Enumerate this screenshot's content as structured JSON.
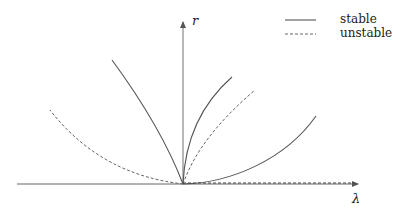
{
  "diagram": {
    "type": "bifurcation-diagram",
    "axes": {
      "horizontal_label": "λ",
      "vertical_label": "r"
    },
    "legend": [
      {
        "style": "solid",
        "label": "stable"
      },
      {
        "style": "dashed",
        "label": "unstable"
      }
    ],
    "branches": [
      {
        "name": "left-steep",
        "style": "solid",
        "direction": "up-left"
      },
      {
        "name": "left-shallow",
        "style": "dashed",
        "direction": "up-left"
      },
      {
        "name": "right-steep",
        "style": "solid",
        "direction": "up-right"
      },
      {
        "name": "right-middle",
        "style": "dashed",
        "direction": "up-right"
      },
      {
        "name": "right-shallow",
        "style": "solid",
        "direction": "up-right"
      },
      {
        "name": "trivial-positive",
        "style": "dashed",
        "direction": "along-lambda-axis"
      }
    ],
    "colors": {
      "line": "#555555",
      "axis": "#666666",
      "background": "#ffffff"
    }
  }
}
